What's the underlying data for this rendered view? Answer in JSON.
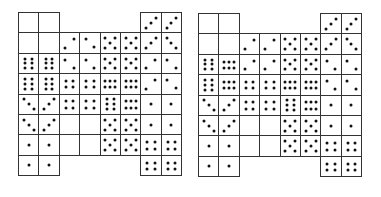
{
  "diagram": {
    "cell_size": 20.4,
    "ink_color": "#111111",
    "line_color": "#333333",
    "note": "Each cell value: null = absent, 'E' = empty cell, otherwise dot pattern key",
    "grids": [
      {
        "name": "left-grid",
        "x": 18,
        "y": 12,
        "rows": [
          [
            "E",
            "E",
            null,
            null,
            null,
            null,
            "3a",
            "3a"
          ],
          [
            "E",
            "E",
            "2a",
            "2b",
            "5",
            "5",
            "3a",
            "3b"
          ],
          [
            "6v",
            "6v",
            "2b",
            "2b",
            "5",
            "5",
            "2a",
            "2b"
          ],
          [
            "6v",
            "6v",
            "4",
            "4",
            "6h",
            "6h",
            "2a",
            "2b"
          ],
          [
            "3b",
            "3a",
            "4",
            "4",
            "6v",
            "6h",
            "1",
            "1"
          ],
          [
            "3b",
            "3a",
            "E",
            "E",
            "5",
            "5",
            "1",
            "1"
          ],
          [
            "1",
            "1",
            "E",
            "E",
            "5",
            "5",
            "4",
            "4"
          ],
          [
            "1",
            "1",
            null,
            null,
            null,
            null,
            "4",
            "4"
          ]
        ]
      },
      {
        "name": "right-grid",
        "x": 198,
        "y": 13,
        "rows": [
          [
            "E",
            "E",
            null,
            null,
            null,
            null,
            "3a",
            "3a"
          ],
          [
            "E",
            "E",
            "2a",
            "2a",
            "5",
            "5",
            "3a",
            "3b"
          ],
          [
            "6v",
            "6h",
            "2a",
            "2a",
            "5",
            "5",
            "2b",
            "2b"
          ],
          [
            "6v",
            "6h",
            "4",
            "4",
            "6h",
            "6h",
            "2b",
            "2b"
          ],
          [
            "3b",
            "3a",
            "4",
            "4",
            "6v",
            "6h",
            "1",
            "1"
          ],
          [
            "3b",
            "3a",
            "E",
            "E",
            "5",
            "5",
            "1",
            "1"
          ],
          [
            "1",
            "1",
            "E",
            "E",
            "5",
            "5",
            "4",
            "4"
          ],
          [
            "1",
            "1",
            null,
            null,
            null,
            null,
            "4",
            "4"
          ]
        ]
      }
    ],
    "patterns": {
      "E": [],
      "1": [
        [
          0.5,
          0.5
        ]
      ],
      "2a": [
        [
          0.25,
          0.75
        ],
        [
          0.72,
          0.3
        ]
      ],
      "2b": [
        [
          0.28,
          0.3
        ],
        [
          0.72,
          0.72
        ]
      ],
      "3a": [
        [
          0.25,
          0.75
        ],
        [
          0.5,
          0.5
        ],
        [
          0.75,
          0.25
        ]
      ],
      "3b": [
        [
          0.25,
          0.25
        ],
        [
          0.5,
          0.5
        ],
        [
          0.75,
          0.75
        ]
      ],
      "4": [
        [
          0.3,
          0.35
        ],
        [
          0.7,
          0.35
        ],
        [
          0.3,
          0.68
        ],
        [
          0.7,
          0.68
        ]
      ],
      "5": [
        [
          0.25,
          0.25
        ],
        [
          0.75,
          0.25
        ],
        [
          0.5,
          0.5
        ],
        [
          0.25,
          0.75
        ],
        [
          0.75,
          0.75
        ]
      ],
      "6v": [
        [
          0.33,
          0.25
        ],
        [
          0.67,
          0.25
        ],
        [
          0.33,
          0.5
        ],
        [
          0.67,
          0.5
        ],
        [
          0.33,
          0.75
        ],
        [
          0.67,
          0.75
        ]
      ],
      "6h": [
        [
          0.25,
          0.35
        ],
        [
          0.5,
          0.35
        ],
        [
          0.75,
          0.35
        ],
        [
          0.25,
          0.68
        ],
        [
          0.5,
          0.68
        ],
        [
          0.75,
          0.68
        ]
      ]
    }
  }
}
